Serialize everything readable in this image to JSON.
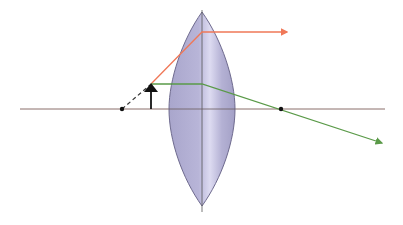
{
  "diagram": {
    "type": "optics-ray-diagram",
    "colors": {
      "background": "#ffffff",
      "axis": "#8a6f6a",
      "lens_fill": "#b4b1d4",
      "lens_stroke": "#6e6a8e",
      "lens_highlight": "#dcdaf0",
      "ray_parallel": "#f07858",
      "ray_focal": "#5a9a48",
      "ray_extension": "#333333",
      "object": "#111111",
      "focal_point": "#111111"
    },
    "optical_axis": {
      "x1": 20,
      "x2": 385,
      "y": 109
    },
    "lens": {
      "center_x": 202,
      "top_y": 12,
      "bottom_y": 206,
      "half_width": 33,
      "center_line_bottom": 212
    },
    "focal_points": [
      {
        "label": "F-left",
        "x": 122,
        "y": 109
      },
      {
        "label": "F-right",
        "x": 281,
        "y": 109
      }
    ],
    "object_arrow": {
      "x": 151,
      "base_y": 109,
      "tip_y": 84
    },
    "rays": [
      {
        "name": "red-ray",
        "points": [
          [
            151,
            84
          ],
          [
            202,
            32
          ],
          [
            289,
            32
          ]
        ],
        "arrow": true
      },
      {
        "name": "green-ray",
        "points": [
          [
            151,
            84
          ],
          [
            202,
            84
          ],
          [
            384,
            144
          ]
        ],
        "arrow": true
      },
      {
        "name": "dashed-extension",
        "points": [
          [
            122,
            109
          ],
          [
            151,
            84
          ]
        ],
        "dashed": true
      }
    ]
  }
}
